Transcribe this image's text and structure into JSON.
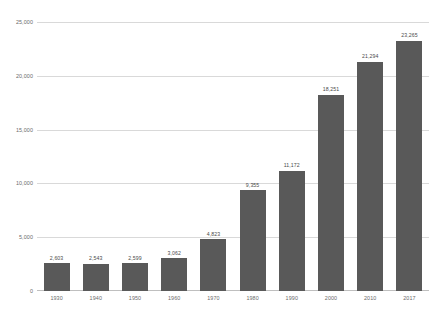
{
  "chart_data": {
    "type": "bar",
    "title": "",
    "subtitle": "",
    "xlabel": "",
    "ylabel": "",
    "categories": [
      "1930",
      "1940",
      "1950",
      "1960",
      "1970",
      "1980",
      "1990",
      "2000",
      "2010",
      "2017"
    ],
    "values": [
      2603,
      2543,
      2599,
      3062,
      4823,
      9355,
      11172,
      18251,
      21294,
      23265
    ],
    "value_labels": [
      "2,603",
      "2,543",
      "2,599",
      "3,062",
      "4,823",
      "9,355",
      "11,172",
      "18,251",
      "21,294",
      "23,265"
    ],
    "ylim": [
      0,
      25000
    ],
    "yticks": [
      0,
      5000,
      10000,
      15000,
      20000,
      25000
    ],
    "ytick_labels": [
      "0",
      "5,000",
      "10,000",
      "15,000",
      "20,000",
      "25,000"
    ],
    "grid": true,
    "legend": false,
    "legend_position": "none",
    "series": [
      {
        "name": "",
        "values": [
          2603,
          2543,
          2599,
          3062,
          4823,
          9355,
          11172,
          18251,
          21294,
          23265
        ]
      }
    ],
    "colors": {
      "bar": "#595959",
      "gridline": "#d9d9d9",
      "axis_text": "#6b6b6b",
      "value_text": "#4a4a4a",
      "background": "#ffffff"
    }
  }
}
